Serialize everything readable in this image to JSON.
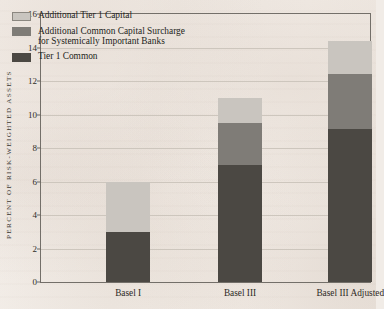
{
  "chart_data": {
    "type": "bar",
    "subtype": "stacked-bar",
    "title": "",
    "xlabel": "",
    "ylabel": "PERCENT OF RISK-WEIGHTED ASSETS",
    "categories": [
      "Basel I",
      "Basel III",
      "Basel III Adjusted"
    ],
    "series": [
      {
        "name": "Tier 1 Common",
        "values": [
          3.0,
          7.0,
          9.15
        ],
        "color": "#4b4843"
      },
      {
        "name": "Additional Common Capital Surcharge\nfor Systemically Important Banks",
        "values": [
          0,
          2.5,
          3.25
        ],
        "color": "#7f7c77"
      },
      {
        "name": "Additional Tier 1 Capital",
        "values": [
          3.0,
          1.5,
          2.0
        ],
        "color": "#c9c5bf"
      }
    ],
    "totals": [
      6.0,
      11.0,
      14.4
    ],
    "ylim": [
      0,
      16
    ],
    "yticks": [
      0,
      2,
      4,
      6,
      8,
      10,
      12,
      14,
      16
    ],
    "ytick_labels": [
      "0",
      "2",
      "4",
      "6",
      "8",
      "10",
      "12",
      "14",
      "16"
    ],
    "grid": true,
    "legend_position": "top-left",
    "stack_order_bottom_to_top": [
      "Tier 1 Common",
      "Additional Common Capital Surcharge for Systemically Important Banks",
      "Additional Tier 1 Capital"
    ]
  },
  "legend": {
    "items": [
      {
        "label": "Additional Tier 1 Capital",
        "swatch": "sw-light"
      },
      {
        "label": "Additional Common Capital Surcharge\nfor Systemically Important Banks",
        "swatch": "sw-mid"
      },
      {
        "label": "Tier 1 Common",
        "swatch": "sw-dark"
      }
    ]
  },
  "colors": {
    "background": "#f1ece7",
    "axis": "#736f69",
    "gridline": "#cdc6bd",
    "tier1_common": "#4b4843",
    "surcharge": "#7f7c77",
    "additional_tier1": "#c9c5bf"
  }
}
